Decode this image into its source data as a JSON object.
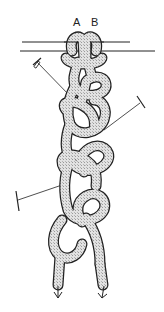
{
  "diagram": {
    "labels": {
      "cord_a": "A",
      "cord_b": "B"
    },
    "elements": {
      "bar": "horizontal support bar (two lines)",
      "pins": 3,
      "direction_arrows": 2
    },
    "colors": {
      "outline": "#222222",
      "cord_fill": "#cfcfcf",
      "background": "#ffffff"
    }
  }
}
